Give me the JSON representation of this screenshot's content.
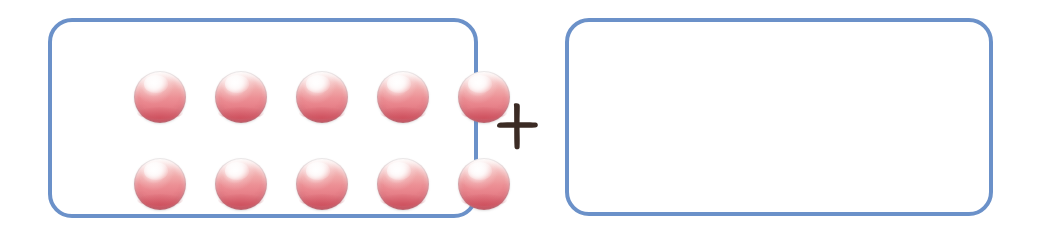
{
  "scene": {
    "title": "Ten-frame addition worksheet",
    "background_color": "#ffffff",
    "width": 1061,
    "height": 239
  },
  "colors": {
    "box_border": "#6b91c9",
    "counter_body": "#e8838b",
    "counter_highlight": "#ffffff",
    "counter_rim_shadow": "#cf6671",
    "plus_sign": "#3b2b24"
  },
  "groups": [
    {
      "name": "left-group",
      "label": "",
      "counter_count": 10,
      "rows": [
        {
          "name": "top-row",
          "count": 5
        },
        {
          "name": "bottom-row",
          "count": 5
        }
      ]
    },
    {
      "name": "right-group",
      "label": "",
      "counter_count": 0,
      "rows": []
    }
  ],
  "operator": {
    "name": "plus-sign",
    "symbol": "+",
    "alt_text": "plus"
  },
  "equation": {
    "left_addend": 10,
    "right_addend": null,
    "operator_symbol": "+",
    "sum": null
  }
}
